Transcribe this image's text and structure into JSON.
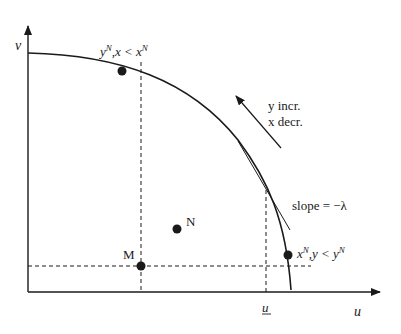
{
  "figure": {
    "type": "utility possibility frontier diagram",
    "axes": {
      "x_label": "u",
      "y_label": "v",
      "x_tick_label": "u"
    },
    "points": [
      {
        "id": "upper",
        "label_main": "y",
        "label_sup": "N",
        "label_rest": ",x < x",
        "label_sup2": "N"
      },
      {
        "id": "lower",
        "label_main": "x",
        "label_sup": "N",
        "label_rest": ",y < y",
        "label_sup2": "N"
      },
      {
        "id": "M",
        "label": "M"
      },
      {
        "id": "N",
        "label": "N"
      }
    ],
    "annotations": {
      "direction_line1": "y incr.",
      "direction_line2": "x decr.",
      "slope_text": "slope = −λ"
    },
    "colors": {
      "ink": "#1a1a1a",
      "background": "#ffffff"
    }
  }
}
